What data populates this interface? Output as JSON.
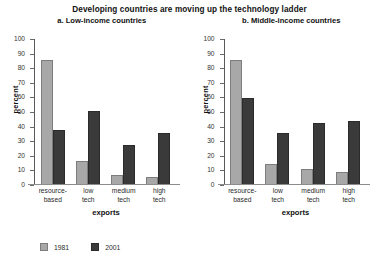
{
  "figure": {
    "title": "Developing countries are moving up the technology ladder"
  },
  "legend": {
    "position": "bottom-left",
    "items": [
      {
        "label": "1981",
        "color": "#a8a8a8",
        "swatch_name": "legend-swatch-1981"
      },
      {
        "label": "2001",
        "color": "#3a3a3a",
        "swatch_name": "legend-swatch-2001"
      }
    ]
  },
  "chart_data": [
    {
      "type": "bar",
      "title": "a. Low-income countries",
      "xlabel": "exports",
      "ylabel": "percent",
      "ylim": [
        0,
        100
      ],
      "yticks": [
        0,
        10,
        20,
        30,
        40,
        50,
        60,
        70,
        80,
        90,
        100
      ],
      "grid": false,
      "legend_position": "bottom-left",
      "categories": [
        "resource-\nbased",
        "low\ntech",
        "medium\ntech",
        "high\ntech"
      ],
      "categories_flat": [
        "resource-based",
        "low tech",
        "medium tech",
        "high tech"
      ],
      "series": [
        {
          "name": "1981",
          "color": "#a8a8a8",
          "values": [
            85,
            16,
            6,
            5
          ]
        },
        {
          "name": "2001",
          "color": "#3a3a3a",
          "values": [
            37,
            50,
            27,
            35
          ]
        }
      ]
    },
    {
      "type": "bar",
      "title": "b. Middle-income countries",
      "xlabel": "exports",
      "ylabel": "percent",
      "ylim": [
        0,
        100
      ],
      "yticks": [
        0,
        10,
        20,
        30,
        40,
        50,
        60,
        70,
        80,
        90,
        100
      ],
      "grid": false,
      "legend_position": "bottom-left",
      "categories": [
        "resource-\nbased",
        "low\ntech",
        "medium\ntech",
        "high\ntech"
      ],
      "categories_flat": [
        "resource-based",
        "low tech",
        "medium tech",
        "high tech"
      ],
      "series": [
        {
          "name": "1981",
          "color": "#a8a8a8",
          "values": [
            85,
            14,
            10,
            8
          ]
        },
        {
          "name": "2001",
          "color": "#3a3a3a",
          "values": [
            59,
            35,
            42,
            43
          ]
        }
      ]
    }
  ]
}
